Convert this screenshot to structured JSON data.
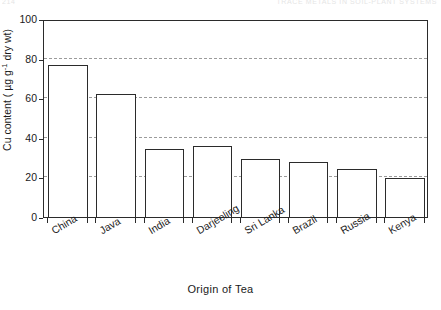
{
  "page_header": {
    "folio": "214",
    "running_title": "TRACE METALS IN SOIL-PLANT SYSTEMS"
  },
  "chart_data": {
    "type": "bar",
    "title": "",
    "xlabel": "Origin of Tea",
    "ylabel": "Cu content ( µg g",
    "ylabel_sup": "-1",
    "ylabel_tail": " dry wt)",
    "categories": [
      "China",
      "Java",
      "India",
      "Darjeeling",
      "Sri Lanka",
      "Brazil",
      "Russia",
      "Kenya"
    ],
    "values": [
      77,
      62,
      34.5,
      36,
      29.5,
      28,
      24.5,
      19.5
    ],
    "ylim": [
      0,
      100
    ],
    "yticks": [
      0,
      20,
      40,
      60,
      80,
      100
    ],
    "ytick_labels": [
      "0",
      "20",
      "40",
      "60",
      "80",
      "100"
    ],
    "gridlines": [
      20,
      40,
      60,
      80
    ],
    "grid": true,
    "legend": "none",
    "bar_fill": "#ffffff",
    "bar_edge": "#2b2b2b",
    "grid_color": "#9b9b9b"
  }
}
